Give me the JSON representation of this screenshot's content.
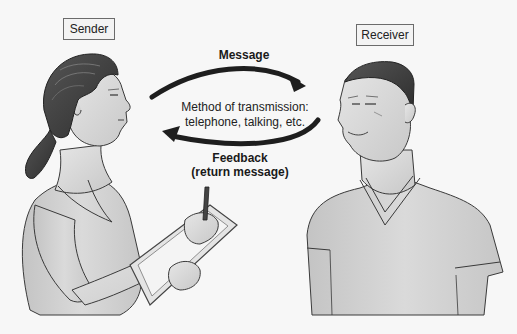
{
  "diagram": {
    "sender": {
      "label": "Sender"
    },
    "receiver": {
      "label": "Receiver"
    },
    "message_arrow": {
      "label": "Message",
      "direction": "sender-to-receiver"
    },
    "feedback_arrow": {
      "label_line1": "Feedback",
      "label_line2": "(return message)",
      "direction": "receiver-to-sender"
    },
    "medium": {
      "line1": "Method of transmission:",
      "line2": "telephone, talking, etc."
    },
    "colors": {
      "background": "#f7f7f7",
      "arrow": "#1e1e1e",
      "box_border": "#6b6b6b",
      "figure_fill": "#d4d4d4",
      "figure_outline": "#3a3a3a",
      "hair": "#4a4a4a"
    }
  }
}
